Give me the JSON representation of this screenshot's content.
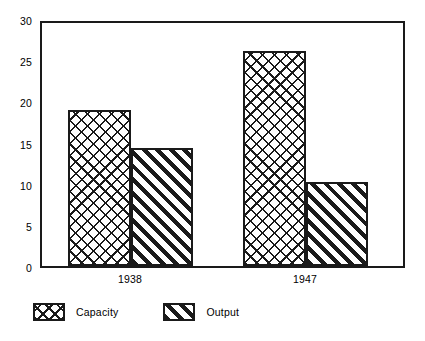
{
  "chart_data": {
    "type": "bar",
    "title": "",
    "subtitle": "",
    "xlabel": "",
    "ylabel": "",
    "categories": [
      "1938",
      "1947"
    ],
    "series": [
      {
        "name": "Capacity",
        "values": [
          19.2,
          26.6
        ],
        "pattern": "cross-hatch"
      },
      {
        "name": "Output",
        "values": [
          14.6,
          10.4
        ],
        "pattern": "diagonal-hatch"
      }
    ],
    "ylim": [
      0,
      30
    ],
    "ytick_labels": [
      "0",
      "5",
      "10",
      "15",
      "20",
      "25",
      "30"
    ],
    "ytick_values": [
      0,
      5,
      10,
      15,
      20,
      25,
      30
    ],
    "grid": false,
    "legend_position": "bottom-left",
    "colors": {
      "ink": "#1a1a1a",
      "background": "#ffffff"
    }
  },
  "axes": {
    "y_ticks": [
      {
        "label": "30",
        "value": 30
      },
      {
        "label": "25",
        "value": 25
      },
      {
        "label": "20",
        "value": 20
      },
      {
        "label": "15",
        "value": 15
      },
      {
        "label": "10",
        "value": 10
      },
      {
        "label": "5",
        "value": 5
      },
      {
        "label": "0",
        "value": 0
      }
    ],
    "x_ticks": [
      {
        "label": "1938"
      },
      {
        "label": "1947"
      }
    ]
  },
  "legend": {
    "entries": [
      {
        "label": "Capacity",
        "pattern": "cross-hatch"
      },
      {
        "label": "Output",
        "pattern": "diagonal-hatch"
      }
    ]
  }
}
